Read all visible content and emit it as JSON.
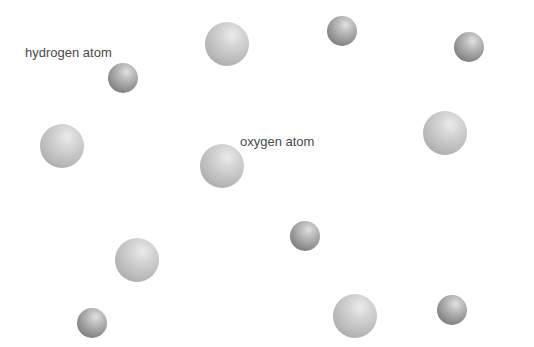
{
  "labels": {
    "hydrogen": "hydrogen atom",
    "oxygen": "oxygen atom"
  },
  "colors": {
    "background": "#ffffff",
    "label_text": "#4a4a4a",
    "oxygen_atom": "#c0c0c0",
    "hydrogen_atom": "#909090"
  },
  "atoms": [
    {
      "type": "oxygen",
      "cx": 227,
      "cy": 44,
      "r": 22
    },
    {
      "type": "hydrogen",
      "cx": 342,
      "cy": 31,
      "r": 15
    },
    {
      "type": "hydrogen",
      "cx": 469,
      "cy": 47,
      "r": 15
    },
    {
      "type": "hydrogen",
      "cx": 123,
      "cy": 78,
      "r": 15
    },
    {
      "type": "oxygen",
      "cx": 62,
      "cy": 146,
      "r": 22
    },
    {
      "type": "oxygen",
      "cx": 222,
      "cy": 166,
      "r": 22
    },
    {
      "type": "oxygen",
      "cx": 445,
      "cy": 133,
      "r": 22
    },
    {
      "type": "hydrogen",
      "cx": 305,
      "cy": 236,
      "r": 15
    },
    {
      "type": "oxygen",
      "cx": 137,
      "cy": 260,
      "r": 22
    },
    {
      "type": "hydrogen",
      "cx": 92,
      "cy": 323,
      "r": 15
    },
    {
      "type": "oxygen",
      "cx": 355,
      "cy": 316,
      "r": 22
    },
    {
      "type": "hydrogen",
      "cx": 452,
      "cy": 310,
      "r": 15
    }
  ]
}
